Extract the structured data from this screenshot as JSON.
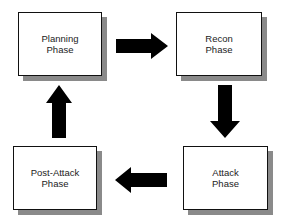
{
  "diagram": {
    "type": "cycle",
    "colors": {
      "box_border": "#111111",
      "box_fill": "#ffffff",
      "shadow": "#8a8a8a",
      "arrow": "#000000",
      "text": "#222222"
    },
    "nodes": [
      {
        "id": "planning",
        "line1": "Planning",
        "line2": "Phase"
      },
      {
        "id": "recon",
        "line1": "Recon",
        "line2": "Phase"
      },
      {
        "id": "attack",
        "line1": "Attack",
        "line2": "Phase"
      },
      {
        "id": "post_attack",
        "line1": "Post-Attack",
        "line2": "Phase"
      }
    ],
    "edges": [
      {
        "from": "planning",
        "to": "recon",
        "direction": "right"
      },
      {
        "from": "recon",
        "to": "attack",
        "direction": "down"
      },
      {
        "from": "attack",
        "to": "post_attack",
        "direction": "left"
      },
      {
        "from": "post_attack",
        "to": "planning",
        "direction": "up"
      }
    ]
  }
}
